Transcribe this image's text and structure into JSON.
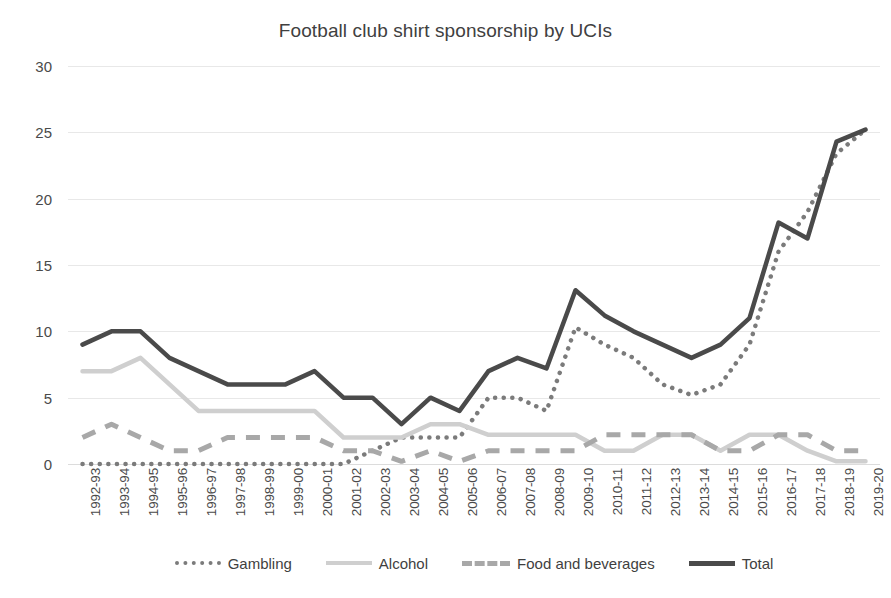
{
  "chart_data": {
    "type": "line",
    "title": "Football club shirt sponsorship by UCIs",
    "xlabel": "",
    "ylabel": "",
    "ylim": [
      0,
      30
    ],
    "yticks": [
      0,
      5,
      10,
      15,
      20,
      25,
      30
    ],
    "grid": true,
    "legend_position": "bottom",
    "categories": [
      "1992-93",
      "1993-94",
      "1994-95",
      "1995-96",
      "1996-97",
      "1997-98",
      "1998-99",
      "1999-00",
      "2000-01",
      "2001-02",
      "2002-03",
      "2003-04",
      "2004-05",
      "2005-06",
      "2006-07",
      "2007-08",
      "2008-09",
      "2009-10",
      "2010-11",
      "2011-12",
      "2012-13",
      "2013-14",
      "2014-15",
      "2015-16",
      "2016-17",
      "2017-18",
      "2018-19",
      "2019-20"
    ],
    "series": [
      {
        "name": "Gambling",
        "style": "dotted",
        "color": "#7b7b7b",
        "values": [
          0,
          0,
          0,
          0,
          0,
          0,
          0,
          0,
          0,
          0,
          1,
          2,
          2,
          2,
          5,
          5,
          4,
          10.3,
          9,
          8,
          6,
          5.2,
          6,
          9,
          16,
          19,
          23.4,
          25.2
        ]
      },
      {
        "name": "Alcohol",
        "style": "solid",
        "color": "#cfcfcf",
        "values": [
          7,
          7,
          8,
          6,
          4,
          4,
          4,
          4,
          4,
          2,
          2,
          2,
          3,
          3,
          2.2,
          2.2,
          2.2,
          2.2,
          1,
          1,
          2.2,
          2.2,
          1,
          2.2,
          2.2,
          1,
          0.2,
          0.2
        ]
      },
      {
        "name": "Food and beverages",
        "style": "dashed",
        "color": "#a8a8a8",
        "values": [
          2,
          3,
          2,
          1,
          1,
          2,
          2,
          2,
          2,
          1,
          1,
          0.2,
          1,
          0.2,
          1,
          1,
          1,
          1,
          2.2,
          2.2,
          2.2,
          2.2,
          1,
          1,
          2.2,
          2.2,
          1,
          1
        ]
      },
      {
        "name": "Total",
        "style": "solid",
        "color": "#4a4a4a",
        "values": [
          9,
          10,
          10,
          8,
          7,
          6,
          6,
          6,
          7,
          5,
          5,
          3,
          5,
          4,
          7,
          8,
          7.2,
          13.1,
          11.2,
          10,
          9,
          8,
          9,
          11,
          18.2,
          17,
          24.3,
          25.2
        ]
      }
    ]
  },
  "legend": {
    "items": [
      {
        "label": "Gambling"
      },
      {
        "label": "Alcohol"
      },
      {
        "label": "Food and beverages"
      },
      {
        "label": "Total"
      }
    ]
  }
}
